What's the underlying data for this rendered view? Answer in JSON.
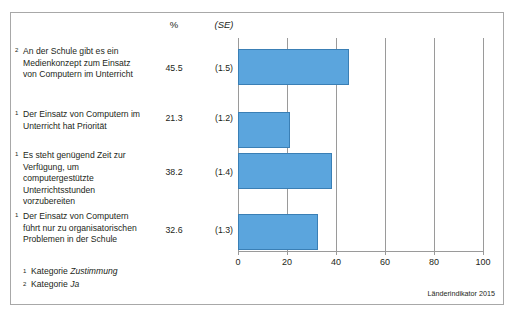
{
  "figure": {
    "source_note": "Länderindikator 2015",
    "headers": {
      "percent": "%",
      "se": "(SE)"
    },
    "footnotes": [
      {
        "marker": "1",
        "prefix": "Kategorie ",
        "italic": "Zustimmung"
      },
      {
        "marker": "2",
        "prefix": "Kategorie ",
        "italic": "Ja"
      }
    ]
  },
  "chart_data": {
    "type": "bar",
    "orientation": "horizontal",
    "title": "",
    "xlabel": "",
    "ylabel": "",
    "xlim": [
      0,
      100
    ],
    "xticks": [
      0,
      20,
      40,
      60,
      80,
      100
    ],
    "xtick_labels": [
      "0",
      "20",
      "40",
      "60",
      "80",
      "100"
    ],
    "grid": true,
    "legend": false,
    "bar_color": "#5ba5dd",
    "bar_border_color": "#3a7fb5",
    "categories": [
      "An der Schule gibt es ein Medienkonzept zum Einsatz von Computern im Unterricht",
      "Der Einsatz von Computern im Unterricht hat Priorität",
      "Es steht genügend Zeit zur Verfügung, um computergestützte Unterrichtsstunden vorzubereiten",
      "Der Einsatz von Computern führt nur zu organisatorischen Problemen in der Schule"
    ],
    "category_markers": [
      "2",
      "1",
      "1",
      "1"
    ],
    "values": [
      45.5,
      21.3,
      38.2,
      32.6
    ],
    "value_labels": [
      "45.5",
      "21.3",
      "38.2",
      "32.6"
    ],
    "standard_errors": [
      1.5,
      1.2,
      1.4,
      1.3
    ],
    "se_labels": [
      "(1.5)",
      "(1.2)",
      "(1.4)",
      "(1.3)"
    ],
    "series": [
      {
        "name": "Prozent",
        "values": [
          45.5,
          21.3,
          38.2,
          32.6
        ]
      }
    ]
  }
}
